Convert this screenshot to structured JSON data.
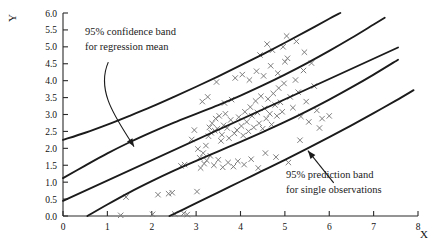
{
  "chart_data": {
    "type": "scatter",
    "title": "",
    "xlabel": "X",
    "ylabel": "Y",
    "xlim": [
      0,
      8
    ],
    "ylim": [
      0.0,
      6.0
    ],
    "grid": false,
    "legend_position": "none",
    "x_ticks": [
      "0",
      "1",
      "2",
      "3",
      "4",
      "5",
      "6",
      "7",
      "8"
    ],
    "x_tick_values": [
      0,
      1,
      2,
      3,
      4,
      5,
      6,
      7,
      8
    ],
    "y_ticks": [
      "0.0",
      "0.5",
      "1.0",
      "1.5",
      "2.0",
      "2.5",
      "3.0",
      "3.5",
      "4.0",
      "4.5",
      "5.0",
      "5.5",
      "6.0"
    ],
    "y_tick_values": [
      0.0,
      0.5,
      1.0,
      1.5,
      2.0,
      2.5,
      3.0,
      3.5,
      4.0,
      4.5,
      5.0,
      5.5,
      6.0
    ],
    "marker": "x",
    "marker_color": "#777777",
    "line_color": "#1b1b1b",
    "annotations": [
      {
        "name": "confidence-band-annotation",
        "line1": "95% confidence band",
        "line2": "for regression mean",
        "text_x": 1.0,
        "text_y": 5.45,
        "arrow_style": "curved",
        "arrow_from": [
          1.02,
          4.55
        ],
        "arrow_to": [
          1.6,
          2.05
        ]
      },
      {
        "name": "prediction-band-annotation",
        "line1": "95% prediction band",
        "line2": "for single observations",
        "text_x": 5.25,
        "text_y": 1.1,
        "arrow_style": "straight",
        "arrow_from": [
          6.1,
          0.98
        ],
        "arrow_to": [
          5.52,
          1.93
        ]
      }
    ],
    "fit": {
      "name": "regression-line",
      "intercept": 0.45,
      "slope": 0.6,
      "x_start": 0.0,
      "x_end": 7.55
    },
    "series": [
      {
        "name": "upper-prediction-band",
        "type": "curve",
        "points": [
          [
            0.0,
            2.25
          ],
          [
            0.5,
            2.46
          ],
          [
            1.0,
            2.7
          ],
          [
            1.5,
            2.96
          ],
          [
            2.0,
            3.23
          ],
          [
            2.5,
            3.52
          ],
          [
            3.0,
            3.82
          ],
          [
            3.5,
            4.13
          ],
          [
            4.0,
            4.45
          ],
          [
            4.5,
            4.78
          ],
          [
            5.0,
            5.12
          ],
          [
            5.5,
            5.47
          ],
          [
            6.0,
            5.83
          ],
          [
            6.25,
            6.0
          ]
        ]
      },
      {
        "name": "upper-confidence-band",
        "type": "curve",
        "points": [
          [
            0.0,
            1.12
          ],
          [
            0.5,
            1.49
          ],
          [
            1.0,
            1.85
          ],
          [
            1.5,
            2.18
          ],
          [
            2.0,
            2.48
          ],
          [
            2.5,
            2.76
          ],
          [
            3.0,
            3.02
          ],
          [
            3.5,
            3.28
          ],
          [
            4.0,
            3.56
          ],
          [
            4.5,
            3.86
          ],
          [
            5.0,
            4.18
          ],
          [
            5.5,
            4.52
          ],
          [
            6.0,
            4.88
          ],
          [
            6.5,
            5.26
          ],
          [
            7.0,
            5.66
          ],
          [
            7.25,
            5.86
          ]
        ]
      },
      {
        "name": "lower-confidence-band",
        "type": "curve",
        "points": [
          [
            0.55,
            0.0
          ],
          [
            1.0,
            0.34
          ],
          [
            1.5,
            0.7
          ],
          [
            2.0,
            1.03
          ],
          [
            2.5,
            1.34
          ],
          [
            3.0,
            1.63
          ],
          [
            3.5,
            1.91
          ],
          [
            4.0,
            2.19
          ],
          [
            4.5,
            2.48
          ],
          [
            5.0,
            2.78
          ],
          [
            5.5,
            3.1
          ],
          [
            6.0,
            3.44
          ],
          [
            6.5,
            3.8
          ],
          [
            7.0,
            4.18
          ],
          [
            7.55,
            4.62
          ]
        ]
      },
      {
        "name": "lower-prediction-band",
        "type": "curve",
        "points": [
          [
            2.4,
            0.0
          ],
          [
            2.75,
            0.22
          ],
          [
            3.0,
            0.38
          ],
          [
            3.5,
            0.7
          ],
          [
            4.0,
            1.02
          ],
          [
            4.5,
            1.34
          ],
          [
            5.0,
            1.66
          ],
          [
            5.5,
            1.99
          ],
          [
            6.0,
            2.33
          ],
          [
            6.5,
            2.68
          ],
          [
            7.0,
            3.04
          ],
          [
            7.5,
            3.41
          ],
          [
            7.9,
            3.72
          ]
        ]
      },
      {
        "name": "observations",
        "type": "scatter",
        "n_points": 112,
        "points": [
          [
            1.3,
            0.02
          ],
          [
            1.42,
            0.56
          ],
          [
            2.02,
            0.05
          ],
          [
            2.14,
            0.63
          ],
          [
            2.38,
            0.66
          ],
          [
            2.46,
            0.69
          ],
          [
            2.52,
            0.06
          ],
          [
            2.72,
            0.08
          ],
          [
            2.8,
            0.04
          ],
          [
            2.66,
            1.48
          ],
          [
            2.74,
            1.52
          ],
          [
            3.02,
            0.72
          ],
          [
            3.1,
            1.42
          ],
          [
            3.18,
            1.55
          ],
          [
            3.22,
            2.08
          ],
          [
            3.28,
            2.36
          ],
          [
            3.34,
            2.46
          ],
          [
            3.3,
            2.62
          ],
          [
            3.36,
            2.74
          ],
          [
            3.42,
            2.52
          ],
          [
            3.48,
            2.58
          ],
          [
            3.44,
            2.88
          ],
          [
            3.52,
            2.96
          ],
          [
            3.58,
            2.4
          ],
          [
            3.56,
            2.22
          ],
          [
            3.62,
            2.68
          ],
          [
            3.66,
            3.02
          ],
          [
            3.7,
            2.6
          ],
          [
            3.74,
            2.3
          ],
          [
            3.78,
            2.84
          ],
          [
            3.14,
            3.38
          ],
          [
            3.26,
            3.52
          ],
          [
            3.46,
            3.96
          ],
          [
            3.64,
            3.34
          ],
          [
            3.8,
            3.44
          ],
          [
            3.86,
            2.44
          ],
          [
            3.92,
            2.54
          ],
          [
            3.96,
            2.92
          ],
          [
            4.02,
            2.66
          ],
          [
            4.06,
            2.38
          ],
          [
            4.1,
            3.08
          ],
          [
            4.14,
            2.78
          ],
          [
            4.18,
            2.5
          ],
          [
            4.22,
            3.22
          ],
          [
            4.26,
            2.96
          ],
          [
            4.3,
            2.62
          ],
          [
            4.34,
            3.4
          ],
          [
            4.38,
            3.06
          ],
          [
            4.42,
            2.74
          ],
          [
            4.46,
            3.54
          ],
          [
            4.5,
            2.58
          ],
          [
            4.54,
            3.18
          ],
          [
            4.58,
            2.88
          ],
          [
            4.62,
            3.46
          ],
          [
            4.66,
            3.02
          ],
          [
            4.7,
            2.7
          ],
          [
            4.74,
            3.62
          ],
          [
            4.78,
            3.28
          ],
          [
            4.82,
            2.96
          ],
          [
            4.86,
            3.78
          ],
          [
            4.9,
            3.36
          ],
          [
            4.94,
            3.08
          ],
          [
            4.98,
            3.92
          ],
          [
            3.88,
            4.08
          ],
          [
            4.04,
            4.18
          ],
          [
            4.2,
            4.02
          ],
          [
            4.36,
            4.28
          ],
          [
            4.52,
            4.14
          ],
          [
            4.68,
            4.44
          ],
          [
            4.84,
            4.22
          ],
          [
            5.0,
            4.56
          ],
          [
            4.44,
            4.76
          ],
          [
            4.72,
            4.9
          ],
          [
            4.6,
            5.08
          ],
          [
            4.96,
            5.0
          ],
          [
            5.06,
            4.66
          ],
          [
            5.12,
            3.52
          ],
          [
            5.18,
            3.2
          ],
          [
            5.24,
            4.02
          ],
          [
            5.3,
            3.66
          ],
          [
            5.36,
            2.94
          ],
          [
            5.42,
            4.3
          ],
          [
            5.48,
            3.38
          ],
          [
            5.54,
            2.78
          ],
          [
            5.6,
            4.52
          ],
          [
            5.66,
            3.84
          ],
          [
            5.72,
            3.12
          ],
          [
            5.78,
            2.6
          ],
          [
            5.04,
            5.32
          ],
          [
            5.26,
            5.16
          ],
          [
            5.44,
            4.84
          ],
          [
            3.04,
            1.98
          ],
          [
            3.08,
            1.72
          ],
          [
            3.16,
            1.86
          ],
          [
            3.24,
            1.64
          ],
          [
            3.32,
            1.78
          ],
          [
            3.4,
            1.5
          ],
          [
            3.5,
            1.66
          ],
          [
            3.6,
            1.44
          ],
          [
            3.72,
            1.58
          ],
          [
            3.84,
            1.46
          ],
          [
            3.94,
            1.62
          ],
          [
            4.08,
            1.52
          ],
          [
            4.24,
            1.68
          ],
          [
            4.4,
            1.42
          ],
          [
            4.56,
            1.86
          ],
          [
            4.8,
            1.74
          ],
          [
            5.08,
            1.58
          ],
          [
            5.34,
            2.24
          ],
          [
            5.84,
            2.88
          ],
          [
            6.0,
            2.96
          ],
          [
            2.9,
            2.26
          ],
          [
            2.96,
            2.54
          ]
        ]
      }
    ]
  },
  "axis": {
    "x_title": "X",
    "y_title": "Y"
  }
}
